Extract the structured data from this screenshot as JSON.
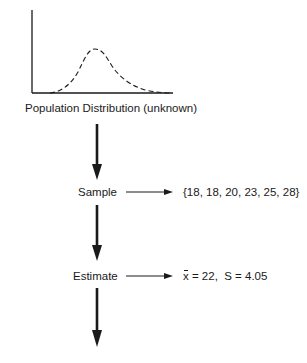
{
  "diagram": {
    "population": {
      "caption": "Population Distribution (unknown)",
      "curve_style": "dashed normal curve"
    },
    "steps": [
      {
        "label": "Sample",
        "result": "{18, 18, 20, 23, 25, 28}"
      },
      {
        "label": "Estimate",
        "result": {
          "mean_symbol": "x",
          "mean_text": " = 22,  S = 4.05"
        }
      }
    ],
    "arrows": {
      "vertical_count": 3,
      "horizontal_count": 2
    },
    "colors": {
      "ink": "#1a1a1a",
      "background": "#ffffff"
    }
  }
}
